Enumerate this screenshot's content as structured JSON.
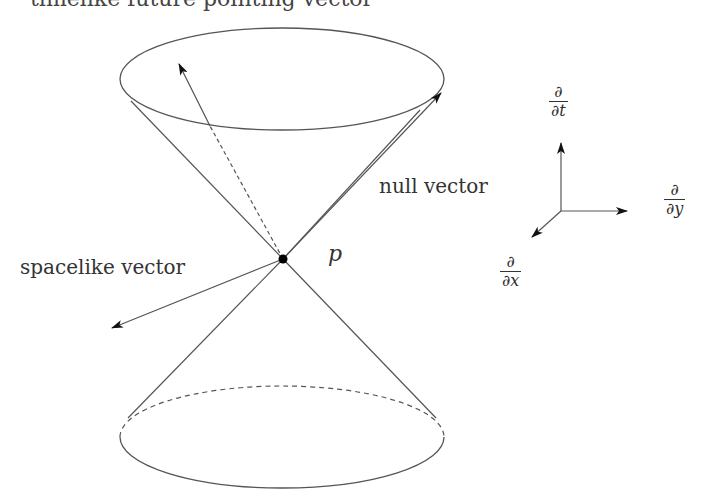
{
  "caption": "timelike future pointing vector",
  "labels": {
    "null_vector": "null vector",
    "spacelike_vector": "spacelike vector",
    "point": "p"
  },
  "axes": {
    "t": {
      "num": "∂",
      "den": "∂t"
    },
    "y": {
      "num": "∂",
      "den": "∂y"
    },
    "x": {
      "num": "∂",
      "den": "∂x"
    }
  },
  "colors": {
    "line": "#555555",
    "arrow": "#111111",
    "point": "#000000"
  }
}
